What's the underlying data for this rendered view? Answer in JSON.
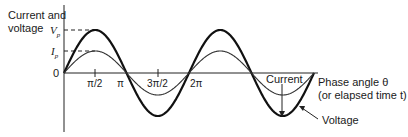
{
  "diagram": {
    "y_axis_label_line1": "Current and",
    "y_axis_label_line2": "voltage",
    "y_ticks": {
      "vp": "V",
      "vp_sub": "p",
      "ip": "I",
      "ip_sub": "p",
      "zero": "0"
    },
    "x_ticks": [
      "π/2",
      "π",
      "3π/2",
      "2π"
    ],
    "x_axis_label_line1": "Phase angle θ",
    "x_axis_label_line2": "(or elapsed time t)",
    "curve_labels": {
      "current": "Current",
      "voltage": "Voltage"
    }
  },
  "chart_data": {
    "type": "line",
    "title": "",
    "xlabel": "Phase angle θ (or elapsed time t)",
    "ylabel": "Current and voltage",
    "x_ticks": [
      "π/2",
      "π",
      "3π/2",
      "2π"
    ],
    "x_range_radians": [
      0,
      12.566
    ],
    "series": [
      {
        "name": "Voltage",
        "function": "Vp·sin(θ)",
        "amplitude": "Vp"
      },
      {
        "name": "Current",
        "function": "Ip·sin(θ)",
        "amplitude": "Ip"
      }
    ],
    "y_ticks": [
      "Vp",
      "Ip",
      "0"
    ],
    "grid": false
  }
}
